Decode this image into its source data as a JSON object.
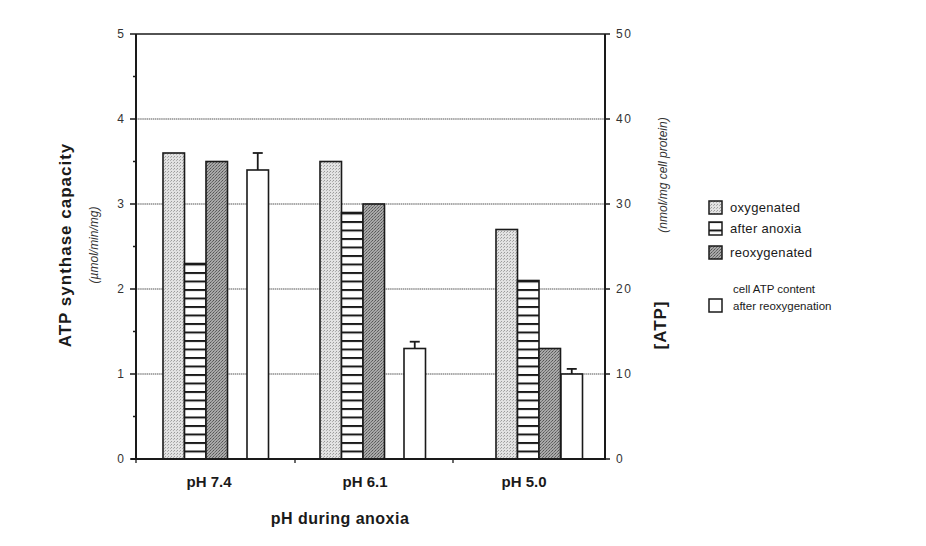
{
  "chart_data": {
    "type": "bar",
    "title": "",
    "xlabel": "pH during anoxia",
    "ylabel": "ATP synthase capacity",
    "ylabel_unit": "(µmol/min/mg)",
    "y2label": "[ATP]",
    "y2label_unit": "(nmol/mg cell protein)",
    "categories": [
      "pH 7.4",
      "pH 6.1",
      "pH 5.0"
    ],
    "ylim": [
      0,
      5
    ],
    "y2lim": [
      0,
      50
    ],
    "yticks": [
      "0",
      "1",
      "2",
      "3",
      "4",
      "5"
    ],
    "y2ticks": [
      "0",
      "10",
      "20",
      "30",
      "40",
      "50"
    ],
    "grid": true,
    "legend_position": "right",
    "series": [
      {
        "name": "oxygenated",
        "axis": "left",
        "pattern": "light-stipple",
        "values": [
          3.6,
          3.5,
          2.7
        ]
      },
      {
        "name": "after anoxia",
        "axis": "left",
        "pattern": "horizontal-stripes",
        "values": [
          2.3,
          2.9,
          2.1
        ]
      },
      {
        "name": "reoxygenated",
        "axis": "left",
        "pattern": "dark-stipple",
        "values": [
          3.5,
          3.0,
          1.3
        ]
      },
      {
        "name": "cell ATP content after reoxygenation",
        "axis": "right",
        "pattern": "white",
        "values": [
          34,
          13,
          10
        ],
        "error": [
          2,
          0.8,
          0.6
        ]
      }
    ]
  },
  "legend": {
    "items": [
      {
        "label": "oxygenated"
      },
      {
        "label": "after anoxia"
      },
      {
        "label": "reoxygenated"
      },
      {
        "label_line1": "cell ATP content",
        "label_line2": "after reoxygenation"
      }
    ]
  },
  "colors": {
    "light_fill": "#d9d9d9",
    "dark_fill": "#9a9a9a",
    "stroke": "#1a1a1a",
    "grid": "#666666"
  }
}
